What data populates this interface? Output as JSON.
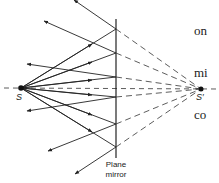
{
  "labels": {
    "source": "S",
    "image": "S′",
    "mirror_line1": "Plane",
    "mirror_line2": "mirror"
  },
  "side_text": [
    "on",
    "mi",
    "co"
  ],
  "geometry": {
    "source": {
      "x": 21,
      "y": 88
    },
    "image": {
      "x": 201,
      "y": 89
    },
    "mirror_x": 116,
    "mirror_y_top": 19,
    "mirror_y_bottom": 158,
    "reflection_points_y": [
      29,
      53,
      77,
      97,
      124,
      147
    ]
  },
  "colors": {
    "ink": "#222222",
    "background": "#ffffff"
  }
}
